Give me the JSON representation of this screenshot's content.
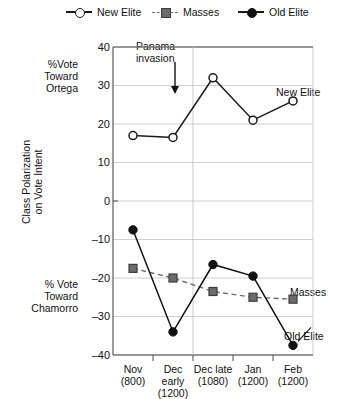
{
  "legend": {
    "items": [
      {
        "label": "New Elite",
        "marker": "open-circle",
        "line": "solid",
        "color": "#1a1a1a"
      },
      {
        "label": "Masses",
        "marker": "gray-square",
        "line": "dashed",
        "color": "#6b6b6b"
      },
      {
        "label": "Old Elite",
        "marker": "filled-circle",
        "line": "solid",
        "color": "#111111"
      }
    ]
  },
  "annotations": {
    "panama": {
      "text": "Panama\ninvasion",
      "arrow": "down-arrow-icon"
    }
  },
  "axis_titles": {
    "top": "%Vote\nToward\nOrtega",
    "bottom": "% Vote\nToward\nChamorro",
    "rotated": "Class Polarization\non Vote Intent"
  },
  "series_labels": {
    "new_elite": "New Elite",
    "masses": "Masses",
    "old_elite": "Old Elite"
  },
  "chart_data": {
    "type": "line",
    "title": "",
    "xlabel": "",
    "ylabel": "Class Polarization on Vote Intent",
    "ylim": [
      -40,
      40
    ],
    "yticks": [
      40,
      30,
      20,
      10,
      0,
      -10,
      -20,
      -30,
      -40
    ],
    "ytick_labels": [
      "40",
      "30",
      "20",
      "10",
      "0",
      "–10",
      "–20",
      "–30",
      "–40"
    ],
    "grid": true,
    "legend_position": "top",
    "categories": [
      "Nov",
      "Dec early",
      "Dec late",
      "Jan",
      "Feb"
    ],
    "category_n": [
      "(800)",
      "(1200)",
      "(1080)",
      "(1200)",
      "(1200)"
    ],
    "xtick_labels": [
      "Nov\n(800)",
      "Dec early\n(1200)",
      "Dec late\n(1080)",
      "Jan\n(1200)",
      "Feb\n(1200)"
    ],
    "series": [
      {
        "name": "New Elite",
        "marker": "open-circle",
        "line": "solid",
        "color": "#1a1a1a",
        "values": [
          17,
          16.5,
          32,
          21,
          26
        ]
      },
      {
        "name": "Masses",
        "marker": "gray-square",
        "line": "dashed",
        "color": "#6b6b6b",
        "values": [
          -17.5,
          -20,
          -23.5,
          -25,
          -25.5
        ]
      },
      {
        "name": "Old Elite",
        "marker": "filled-circle",
        "line": "solid",
        "color": "#111111",
        "values": [
          -7.5,
          -34,
          -16.5,
          -19.5,
          -37.5
        ]
      }
    ],
    "annotations": [
      {
        "text": "Panama invasion",
        "at_category": "Dec early",
        "type": "arrow-down"
      }
    ]
  }
}
